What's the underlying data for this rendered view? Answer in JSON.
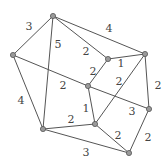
{
  "diagram": {
    "type": "weighted-undirected-graph",
    "nodes": [
      {
        "id": "A",
        "x": 53,
        "y": 16
      },
      {
        "id": "B",
        "x": 13,
        "y": 55
      },
      {
        "id": "C",
        "x": 43,
        "y": 129
      },
      {
        "id": "D",
        "x": 108,
        "y": 59
      },
      {
        "id": "E",
        "x": 145,
        "y": 54
      },
      {
        "id": "F",
        "x": 88,
        "y": 86
      },
      {
        "id": "G",
        "x": 149,
        "y": 109
      },
      {
        "id": "H",
        "x": 95,
        "y": 124
      },
      {
        "id": "I",
        "x": 129,
        "y": 153
      }
    ],
    "edges": [
      {
        "from": "A",
        "to": "B",
        "weight": "3",
        "lx": 29,
        "ly": 26
      },
      {
        "from": "A",
        "to": "C",
        "weight": "5",
        "lx": 58,
        "ly": 44
      },
      {
        "from": "A",
        "to": "D",
        "weight": "2",
        "lx": 86,
        "ly": 51
      },
      {
        "from": "A",
        "to": "E",
        "weight": "4",
        "lx": 109,
        "ly": 28
      },
      {
        "from": "D",
        "to": "E",
        "weight": "1",
        "lx": 121,
        "ly": 63
      },
      {
        "from": "D",
        "to": "F",
        "weight": "2",
        "lx": 93,
        "ly": 71
      },
      {
        "from": "E",
        "to": "H",
        "weight": "2",
        "lx": 119,
        "ly": 81
      },
      {
        "from": "E",
        "to": "G",
        "weight": "2",
        "lx": 158,
        "ly": 85
      },
      {
        "from": "B",
        "to": "F",
        "weight": "2",
        "lx": 63,
        "ly": 85
      },
      {
        "from": "F",
        "to": "G",
        "weight": "3",
        "lx": 132,
        "ly": 111
      },
      {
        "from": "F",
        "to": "H",
        "weight": "1",
        "lx": 86,
        "ly": 108
      },
      {
        "from": "C",
        "to": "H",
        "weight": "2",
        "lx": 71,
        "ly": 119
      },
      {
        "from": "H",
        "to": "I",
        "weight": "2",
        "lx": 118,
        "ly": 135
      },
      {
        "from": "G",
        "to": "I",
        "weight": "2",
        "lx": 148,
        "ly": 137
      },
      {
        "from": "C",
        "to": "I",
        "weight": "3",
        "lx": 86,
        "ly": 152
      },
      {
        "from": "B",
        "to": "C",
        "weight": "4",
        "lx": 21,
        "ly": 100
      }
    ]
  }
}
